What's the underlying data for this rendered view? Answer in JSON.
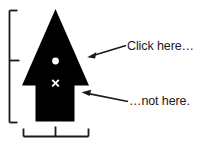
{
  "diagram": {
    "background_color": "#ffffff",
    "shape_color": "#000000",
    "mark_color": "#ffffff",
    "bracket_color": "#1a1a1a",
    "callouts": [
      {
        "id": "click-here",
        "text": "Click here…",
        "points_to": "arrowhead-triangle",
        "arrow_direction": "left-down"
      },
      {
        "id": "not-here",
        "text": "…not here.",
        "points_to": "arrow-stem",
        "arrow_direction": "left-up"
      }
    ],
    "marks": [
      {
        "id": "hotspot-dot",
        "glyph": "dot",
        "meaning": "active click point"
      },
      {
        "id": "miss-x",
        "glyph": "×",
        "meaning": "inactive point"
      }
    ],
    "measure_brackets": [
      {
        "id": "height-bracket",
        "orientation": "vertical",
        "has_midpoint_tick": true
      },
      {
        "id": "width-bracket",
        "orientation": "horizontal",
        "has_midpoint_tick": true
      }
    ]
  }
}
